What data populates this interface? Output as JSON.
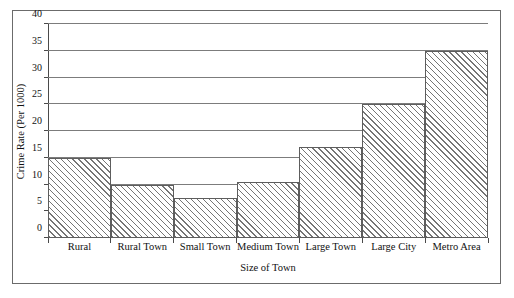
{
  "chart_data": {
    "type": "bar",
    "title": "",
    "xlabel": "Size of Town",
    "ylabel": "Crime Rate (Per 1000)",
    "categories": [
      "Rural",
      "Rural Town",
      "Small Town",
      "Medium Town",
      "Large Town",
      "Large City",
      "Metro Area"
    ],
    "values": [
      15,
      10,
      7.5,
      10.5,
      17,
      25,
      35
    ],
    "ylim": [
      0,
      40
    ],
    "ytick_labels": [
      "0",
      "5",
      "10",
      "15",
      "20",
      "25",
      "30",
      "35",
      "40"
    ],
    "ytick_values": [
      0,
      5,
      10,
      15,
      20,
      25,
      30,
      35,
      40
    ],
    "grid": "horizontal",
    "legend": "none",
    "series": [
      {
        "name": "Crime Rate (Per 1000)",
        "values": [
          15,
          10,
          7.5,
          10.5,
          17,
          25,
          35
        ]
      }
    ],
    "colors": {
      "bar_fill": "#ffffff",
      "bar_hatch": "#6e6e6e",
      "bar_edge": "#5d5d5d",
      "gridline": "#7c7c7c",
      "axis": "#4a4a4a",
      "frame": "#6b6b6b",
      "text": "#111111",
      "background": "#ffffff"
    }
  }
}
